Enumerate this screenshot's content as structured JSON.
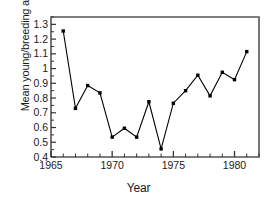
{
  "chart_data": {
    "type": "line",
    "title": "",
    "xlabel": "Year",
    "ylabel": "Mean young/breeding area",
    "xlim": [
      1965,
      1982
    ],
    "ylim": [
      0.4,
      1.35
    ],
    "grid": false,
    "legend": false,
    "marker": "filled-square",
    "line_color": "#000000",
    "marker_color": "#000000",
    "axis_color": "#555555",
    "background": "#ffffff",
    "x_ticks_major": [
      1965,
      1970,
      1975,
      1980
    ],
    "x_tick_labels": [
      "1965",
      "1970",
      "1975",
      "1980"
    ],
    "x_ticks_minor": [
      1966,
      1967,
      1968,
      1969,
      1971,
      1972,
      1973,
      1974,
      1976,
      1977,
      1978,
      1979,
      1981,
      1982
    ],
    "y_ticks": [
      0.4,
      0.5,
      0.6,
      0.7,
      0.8,
      0.9,
      1.0,
      1.1,
      1.2,
      1.3
    ],
    "y_tick_labels": [
      "0.4",
      "0.5",
      "0.6",
      "0.7",
      "0.8",
      "0.9",
      "1",
      "1.1",
      "1.2",
      "1.3"
    ],
    "x": [
      1966,
      1967,
      1968,
      1969,
      1970,
      1971,
      1972,
      1973,
      1974,
      1975,
      1976,
      1977,
      1978,
      1979,
      1980,
      1981
    ],
    "values": [
      1.255,
      0.73,
      0.885,
      0.835,
      0.535,
      0.595,
      0.535,
      0.775,
      0.455,
      0.765,
      0.85,
      0.955,
      0.815,
      0.975,
      0.925,
      1.115
    ],
    "points": [
      {
        "year": 1966,
        "value": 1.255
      },
      {
        "year": 1967,
        "value": 0.73
      },
      {
        "year": 1968,
        "value": 0.885
      },
      {
        "year": 1969,
        "value": 0.835
      },
      {
        "year": 1970,
        "value": 0.535
      },
      {
        "year": 1971,
        "value": 0.595
      },
      {
        "year": 1972,
        "value": 0.535
      },
      {
        "year": 1973,
        "value": 0.775
      },
      {
        "year": 1974,
        "value": 0.455
      },
      {
        "year": 1975,
        "value": 0.765
      },
      {
        "year": 1976,
        "value": 0.85
      },
      {
        "year": 1977,
        "value": 0.955
      },
      {
        "year": 1978,
        "value": 0.815
      },
      {
        "year": 1979,
        "value": 0.975
      },
      {
        "year": 1980,
        "value": 0.925
      },
      {
        "year": 1981,
        "value": 1.115
      }
    ]
  }
}
